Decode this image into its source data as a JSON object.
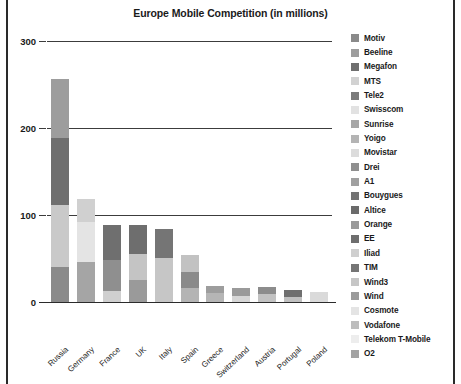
{
  "chart": {
    "title": "Europe Mobile Competition (in millions)"
  },
  "axis": {
    "yticks": [
      "0",
      "100",
      "200",
      "300"
    ],
    "ymin": 0,
    "ymax": 300
  },
  "legend": {
    "items": [
      {
        "label": "Motiv",
        "color": "#8a8a8a"
      },
      {
        "label": "Beeline",
        "color": "#9d9d9d"
      },
      {
        "label": "Megafon",
        "color": "#6f6f6f"
      },
      {
        "label": "MTS",
        "color": "#d2d2d2"
      },
      {
        "label": "Tele2",
        "color": "#7b7b7b"
      },
      {
        "label": "Swisscom",
        "color": "#e2e2e2"
      },
      {
        "label": "Sunrise",
        "color": "#a7a7a7"
      },
      {
        "label": "Yoigo",
        "color": "#b4b4b4"
      },
      {
        "label": "Movistar",
        "color": "#dcdcdc"
      },
      {
        "label": "Drei",
        "color": "#8f8f8f"
      },
      {
        "label": "A1",
        "color": "#a0a0a0"
      },
      {
        "label": "Bouygues",
        "color": "#737373"
      },
      {
        "label": "Altice",
        "color": "#6b6b6b"
      },
      {
        "label": "Orange",
        "color": "#9a9a9a"
      },
      {
        "label": "EE",
        "color": "#6e6e6e"
      },
      {
        "label": "Iliad",
        "color": "#cfcfcf"
      },
      {
        "label": "TIM",
        "color": "#757575"
      },
      {
        "label": "Wind3",
        "color": "#c6c6c6"
      },
      {
        "label": "Wind",
        "color": "#9b9b9b"
      },
      {
        "label": "Cosmote",
        "color": "#e4e4e4"
      },
      {
        "label": "Vodafone",
        "color": "#bdbdbd"
      },
      {
        "label": "Telekom T-Mobile",
        "color": "#ededed"
      },
      {
        "label": "O2",
        "color": "#a3a3a3"
      }
    ]
  },
  "chart_data": {
    "type": "bar",
    "subtype": "stacked-bar",
    "title": "Europe Mobile Competition (in millions)",
    "xlabel": "",
    "ylabel": "",
    "ylim": [
      0,
      300
    ],
    "yticks": [
      0,
      100,
      200,
      300
    ],
    "grid": true,
    "legend_position": "right",
    "categories": [
      "Russia",
      "Germany",
      "France",
      "UK",
      "Italy",
      "Spain",
      "Greece",
      "Switzerland",
      "Austria",
      "Portugal",
      "Poland"
    ],
    "totals": [
      256,
      118,
      88,
      88,
      84,
      54,
      18,
      16,
      17,
      14,
      12
    ],
    "stacks": [
      {
        "category": "Russia",
        "total": 256,
        "segments": [
          {
            "name": "Motiv",
            "value": 40,
            "color": "#8a8a8a"
          },
          {
            "name": "Beeline",
            "value": 72,
            "color": "#c9c9c9"
          },
          {
            "name": "Megafon",
            "value": 77,
            "color": "#6f6f6f"
          },
          {
            "name": "MTS",
            "value": 67,
            "color": "#9d9d9d"
          }
        ]
      },
      {
        "category": "Germany",
        "total": 118,
        "segments": [
          {
            "name": "Vodafone",
            "value": 46,
            "color": "#a5a5a5"
          },
          {
            "name": "Telekom T-Mobile",
            "value": 46,
            "color": "#e4e4e4"
          },
          {
            "name": "O2",
            "value": 26,
            "color": "#d0d0d0"
          }
        ]
      },
      {
        "category": "France",
        "total": 88,
        "segments": [
          {
            "name": "Iliad",
            "value": 13,
            "color": "#cfcfcf"
          },
          {
            "name": "Altice",
            "value": 35,
            "color": "#8f8f8f"
          },
          {
            "name": "Bouygues",
            "value": 40,
            "color": "#6f6f6f"
          }
        ]
      },
      {
        "category": "UK",
        "total": 88,
        "segments": [
          {
            "name": "O2",
            "value": 25,
            "color": "#9a9a9a"
          },
          {
            "name": "Vodafone",
            "value": 30,
            "color": "#c4c4c4"
          },
          {
            "name": "EE",
            "value": 33,
            "color": "#6e6e6e"
          }
        ]
      },
      {
        "category": "Italy",
        "total": 84,
        "segments": [
          {
            "name": "Wind3",
            "value": 51,
            "color": "#c6c6c6"
          },
          {
            "name": "TIM",
            "value": 33,
            "color": "#757575"
          }
        ]
      },
      {
        "category": "Spain",
        "total": 54,
        "segments": [
          {
            "name": "Yoigo",
            "value": 16,
            "color": "#b4b4b4"
          },
          {
            "name": "Orange",
            "value": 19,
            "color": "#8a8a8a"
          },
          {
            "name": "Movistar",
            "value": 19,
            "color": "#c2c2c2"
          }
        ]
      },
      {
        "category": "Greece",
        "total": 18,
        "segments": [
          {
            "name": "Wind",
            "value": 10,
            "color": "#b5b5b5"
          },
          {
            "name": "Cosmote",
            "value": 8,
            "color": "#9d9d9d"
          }
        ]
      },
      {
        "category": "Switzerland",
        "total": 16,
        "segments": [
          {
            "name": "Swisscom",
            "value": 7,
            "color": "#d6d6d6"
          },
          {
            "name": "Sunrise",
            "value": 9,
            "color": "#9a9a9a"
          }
        ]
      },
      {
        "category": "Austria",
        "total": 17,
        "segments": [
          {
            "name": "A1",
            "value": 9,
            "color": "#c2c2c2"
          },
          {
            "name": "Drei",
            "value": 8,
            "color": "#8c8c8c"
          }
        ]
      },
      {
        "category": "Portugal",
        "total": 14,
        "segments": [
          {
            "name": "Vodafone",
            "value": 6,
            "color": "#c0c0c0"
          },
          {
            "name": "MEO",
            "value": 8,
            "color": "#6f6f6f"
          }
        ]
      },
      {
        "category": "Poland",
        "total": 12,
        "segments": [
          {
            "name": "Play",
            "value": 12,
            "color": "#dadada"
          }
        ]
      }
    ]
  }
}
